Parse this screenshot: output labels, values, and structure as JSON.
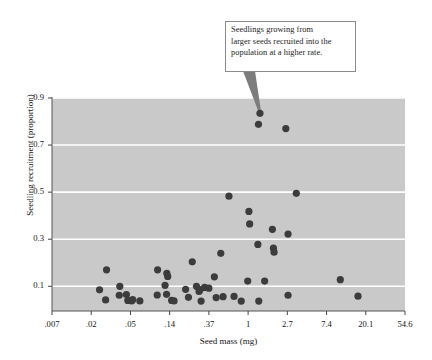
{
  "chart_data": {
    "type": "scatter",
    "title": "",
    "xlabel": "Seed mass (mg)",
    "ylabel": "Seedling recruitment (proportion)",
    "x_scale": "log",
    "y_scale": "linear",
    "xticks": [
      ".007",
      ".02",
      ".05",
      ".14",
      ".37",
      "1",
      "2.7",
      "7.4",
      "20.1",
      "54.6"
    ],
    "xtick_values": [
      0.007,
      0.02,
      0.05,
      0.14,
      0.37,
      1,
      2.7,
      7.4,
      20.1,
      54.6
    ],
    "yticks": [
      "0.9",
      "0.7",
      "0.5",
      "0.3",
      "0.1"
    ],
    "ytick_values": [
      0.9,
      0.7,
      0.5,
      0.3,
      0.1
    ],
    "ylim": [
      -0.005,
      0.9
    ],
    "grid": "horizontal-white-gridlines",
    "legend": "none",
    "marker": {
      "shape": "circle",
      "color": "#3c3c3c",
      "radius_px": 3.6
    },
    "plot_background": "#c9c9c9",
    "annotations": [
      {
        "text": "Seedlings growing from larger seeds recruited into the population at a higher rate.",
        "lines": [
          "Seedlings growing from",
          "larger seeds recruited into the",
          "population at a higher rate."
        ],
        "points_to": {
          "x": 1.35,
          "y": 0.835
        }
      }
    ],
    "points": [
      {
        "x": 0.0286,
        "y": 0.17
      },
      {
        "x": 0.0243,
        "y": 0.085
      },
      {
        "x": 0.028,
        "y": 0.042
      },
      {
        "x": 0.039,
        "y": 0.1
      },
      {
        "x": 0.0385,
        "y": 0.062
      },
      {
        "x": 0.0455,
        "y": 0.065
      },
      {
        "x": 0.047,
        "y": 0.04
      },
      {
        "x": 0.0515,
        "y": 0.038
      },
      {
        "x": 0.053,
        "y": 0.043
      },
      {
        "x": 0.064,
        "y": 0.038
      },
      {
        "x": 0.102,
        "y": 0.17
      },
      {
        "x": 0.101,
        "y": 0.063
      },
      {
        "x": 0.124,
        "y": 0.104
      },
      {
        "x": 0.13,
        "y": 0.155
      },
      {
        "x": 0.133,
        "y": 0.142
      },
      {
        "x": 0.129,
        "y": 0.066
      },
      {
        "x": 0.147,
        "y": 0.04
      },
      {
        "x": 0.156,
        "y": 0.038
      },
      {
        "x": 0.208,
        "y": 0.087
      },
      {
        "x": 0.223,
        "y": 0.053
      },
      {
        "x": 0.245,
        "y": 0.204
      },
      {
        "x": 0.272,
        "y": 0.1
      },
      {
        "x": 0.29,
        "y": 0.078
      },
      {
        "x": 0.298,
        "y": 0.086
      },
      {
        "x": 0.305,
        "y": 0.037
      },
      {
        "x": 0.333,
        "y": 0.095
      },
      {
        "x": 0.37,
        "y": 0.092
      },
      {
        "x": 0.425,
        "y": 0.14
      },
      {
        "x": 0.445,
        "y": 0.052
      },
      {
        "x": 0.5,
        "y": 0.24
      },
      {
        "x": 0.53,
        "y": 0.056
      },
      {
        "x": 0.615,
        "y": 0.483
      },
      {
        "x": 0.7,
        "y": 0.057
      },
      {
        "x": 0.84,
        "y": 0.037
      },
      {
        "x": 0.99,
        "y": 0.122
      },
      {
        "x": 1.02,
        "y": 0.418
      },
      {
        "x": 1.04,
        "y": 0.365
      },
      {
        "x": 1.35,
        "y": 0.835
      },
      {
        "x": 1.3,
        "y": 0.788
      },
      {
        "x": 1.28,
        "y": 0.278
      },
      {
        "x": 1.31,
        "y": 0.037
      },
      {
        "x": 1.52,
        "y": 0.122
      },
      {
        "x": 1.85,
        "y": 0.342
      },
      {
        "x": 1.9,
        "y": 0.262
      },
      {
        "x": 1.93,
        "y": 0.245
      },
      {
        "x": 2.6,
        "y": 0.77
      },
      {
        "x": 2.75,
        "y": 0.322
      },
      {
        "x": 2.75,
        "y": 0.062
      },
      {
        "x": 3.4,
        "y": 0.495
      },
      {
        "x": 10.5,
        "y": 0.128
      },
      {
        "x": 16.5,
        "y": 0.058
      }
    ]
  },
  "axis": {
    "x_title": "Seed mass (mg)",
    "y_title": "Seedling recruitment (proportion)"
  }
}
